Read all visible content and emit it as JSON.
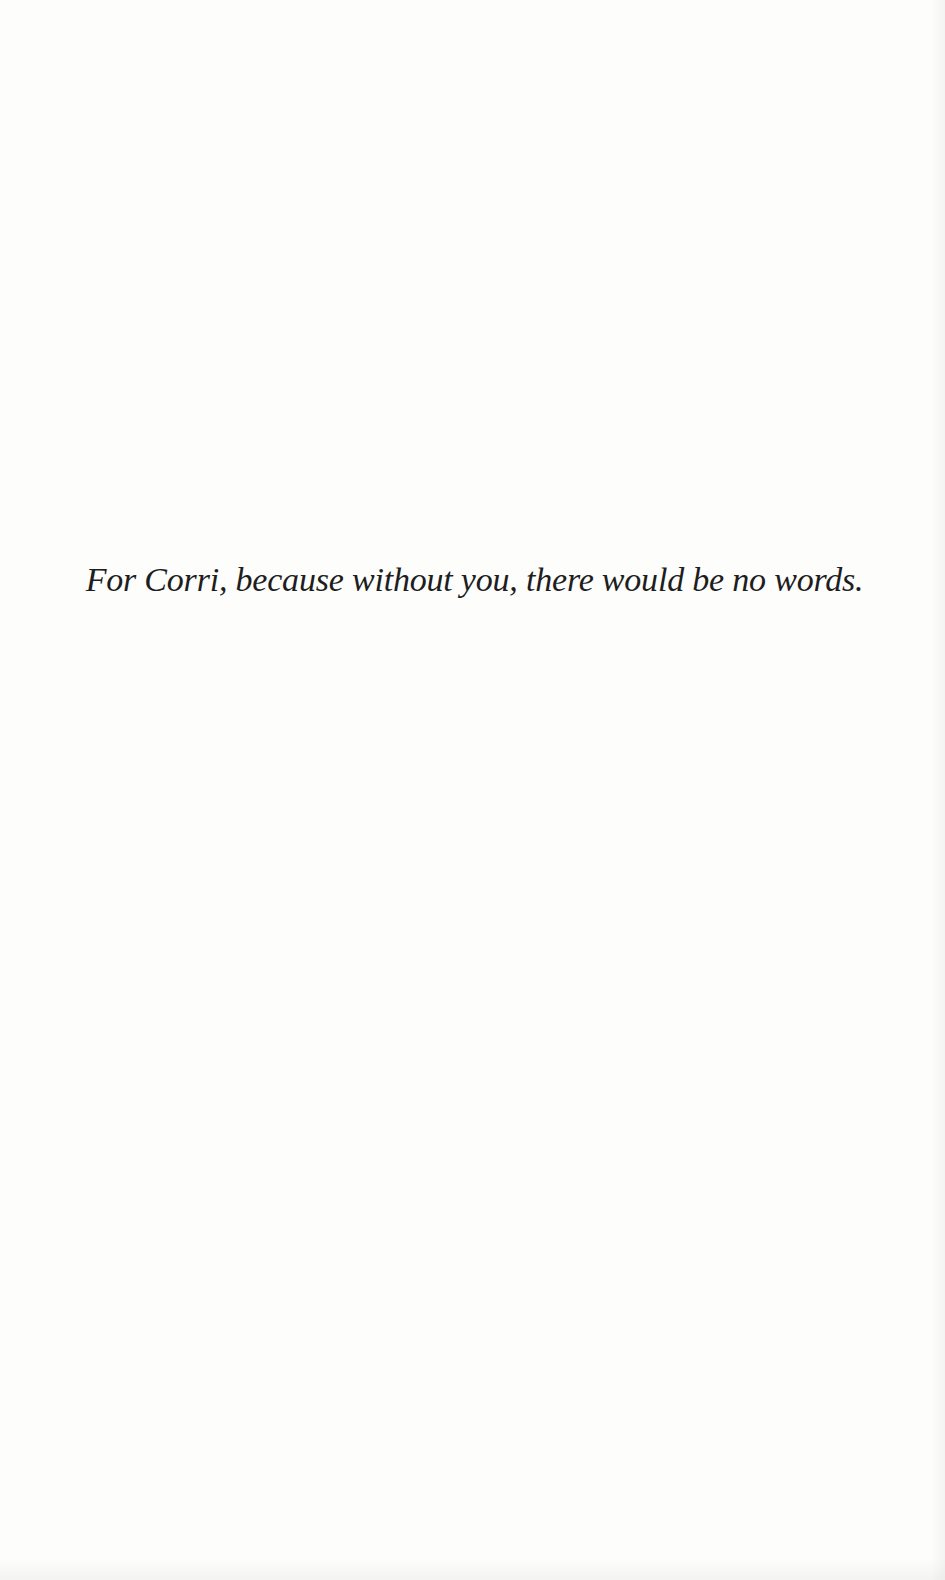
{
  "page": {
    "type": "dedication",
    "background_color": "#fdfdfc",
    "text_color": "#1e1e1e",
    "dedication_text": "For Corri, because without you, there would be no words."
  }
}
